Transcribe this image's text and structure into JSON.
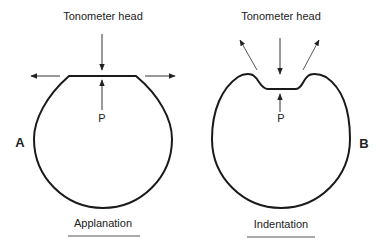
{
  "panels": [
    {
      "id": "A",
      "letter": "A",
      "head_label": "Tonometer head",
      "pressure_label": "P",
      "caption": "Applanation"
    },
    {
      "id": "B",
      "letter": "B",
      "head_label": "Tonometer head",
      "pressure_label": "P",
      "caption": "Indentation"
    }
  ],
  "colors": {
    "stroke": "#1a1a1a",
    "arrow": "#333333",
    "background": "#ffffff"
  }
}
